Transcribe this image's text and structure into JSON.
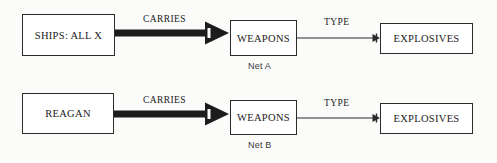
{
  "diagram": {
    "background_color": "#fbfbfa",
    "stroke_color": "#2b2b2b",
    "text_color": "#1a1a1a",
    "rows": [
      {
        "id": "net-a",
        "net_label": "Net A",
        "nodes": [
          {
            "id": "subject-a",
            "label": "SHIPS: ALL X"
          },
          {
            "id": "weapons-a",
            "label": "WEAPONS"
          },
          {
            "id": "explosives-a",
            "label": "EXPLOSIVES"
          }
        ],
        "edges": [
          {
            "id": "carries-a",
            "label": "CARRIES",
            "style": "thick-arrow",
            "from": "subject-a",
            "to": "weapons-a"
          },
          {
            "id": "type-a",
            "label": "TYPE",
            "style": "thin-arrow",
            "from": "weapons-a",
            "to": "explosives-a"
          }
        ]
      },
      {
        "id": "net-b",
        "net_label": "Net B",
        "nodes": [
          {
            "id": "subject-b",
            "label": "REAGAN"
          },
          {
            "id": "weapons-b",
            "label": "WEAPONS"
          },
          {
            "id": "explosives-b",
            "label": "EXPLOSIVES"
          }
        ],
        "edges": [
          {
            "id": "carries-b",
            "label": "CARRIES",
            "style": "thick-arrow",
            "from": "subject-b",
            "to": "weapons-b"
          },
          {
            "id": "type-b",
            "label": "TYPE",
            "style": "thin-arrow",
            "from": "weapons-b",
            "to": "explosives-b"
          }
        ]
      }
    ]
  }
}
